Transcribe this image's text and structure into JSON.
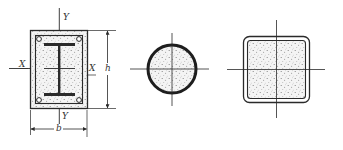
{
  "figure": {
    "colors": {
      "line": "#2a2a2a",
      "concrete_fill": "#f3f3f3",
      "stipple": "#7a7a7a",
      "background": "#ffffff"
    }
  },
  "sections": [
    {
      "id": "encased-i-section",
      "labels": {
        "axis_y_top": "Y",
        "axis_y_bottom": "Y",
        "axis_x_left": "X",
        "axis_x_right": "X",
        "height_dim": "h",
        "width_dim": "b"
      }
    },
    {
      "id": "concrete-filled-circular-tube",
      "labels": {}
    },
    {
      "id": "concrete-filled-square-tube",
      "labels": {}
    }
  ]
}
